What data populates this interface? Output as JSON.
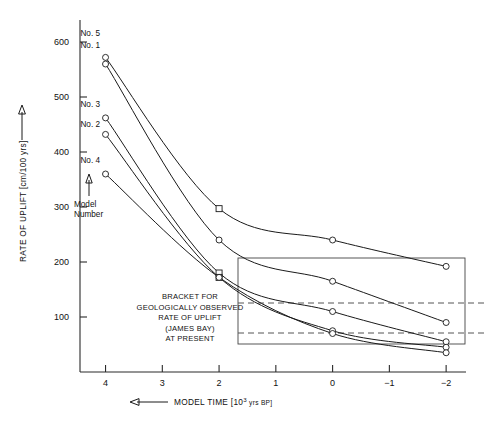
{
  "chart_data": {
    "type": "line",
    "title": "",
    "xlabel": "MODEL TIME [10³ yrs BP]",
    "ylabel": "RATE OF UPLIFT [cm/100 yrs]",
    "xlabel_prefix_arrow": "⟵",
    "ylabel_arrow": "↑",
    "x": [
      4,
      2,
      0,
      -2
    ],
    "xlim": [
      4.45,
      -2.35
    ],
    "ylim": [
      0,
      640
    ],
    "xticks": [
      4,
      3,
      2,
      1,
      0,
      -1,
      -2
    ],
    "xticklabels": [
      "4",
      "3",
      "2",
      "1",
      "0",
      "−1",
      "−2"
    ],
    "yticks": [
      100,
      200,
      300,
      400,
      500,
      600
    ],
    "yticklabels": [
      "100",
      "200",
      "300",
      "400",
      "500",
      "600"
    ],
    "grid": false,
    "legend_position": "inline-left-labels",
    "axis_direction_note": "x axis decreases left to right",
    "series": [
      {
        "name": "No. 5",
        "label": "No. 5",
        "values": [
          572,
          297,
          240,
          192
        ]
      },
      {
        "name": "No. 1",
        "label": "No. 1",
        "values": [
          560,
          240,
          165,
          90
        ]
      },
      {
        "name": "No. 3",
        "label": "No. 3",
        "values": [
          462,
          180,
          110,
          55
        ]
      },
      {
        "name": "No. 2",
        "label": "No. 2",
        "values": [
          432,
          172,
          75,
          45
        ]
      },
      {
        "name": "No. 4",
        "label": "No. 4",
        "values": [
          360,
          172,
          70,
          35
        ]
      }
    ],
    "annotations": {
      "model_number_line1": "Model",
      "model_number_line2": "Number",
      "bracket_lines": [
        "BRACKET FOR",
        "GEOLOGICALLY OBSERVED",
        "RATE OF UPLIFT",
        "(JAMES BAY)",
        "AT PRESENT"
      ],
      "bracket_box": {
        "x_from": 2.0,
        "x_to": -2.35,
        "y_from": 20,
        "y_to": 205
      },
      "bracket_dashed_values": [
        120,
        60
      ]
    },
    "colors": {
      "curve": "#1a1a1a",
      "axis": "#2a2a2a",
      "bracket_box": "#444444",
      "bracket_dash": "#555555",
      "background": "#ffffff"
    }
  }
}
